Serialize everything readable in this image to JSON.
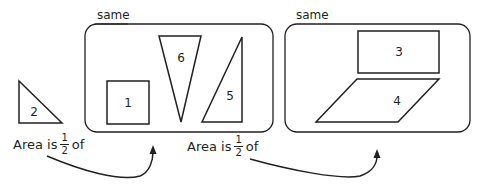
{
  "groups": [
    {
      "label": "same",
      "members": [
        "1",
        "5",
        "6"
      ]
    },
    {
      "label": "same",
      "members": [
        "3",
        "4"
      ]
    }
  ],
  "shapes": {
    "s1": {
      "label": "1",
      "type": "square"
    },
    "s2": {
      "label": "2",
      "type": "right-triangle"
    },
    "s3": {
      "label": "3",
      "type": "rectangle"
    },
    "s4": {
      "label": "4",
      "type": "parallelogram"
    },
    "s5": {
      "label": "5",
      "type": "right-triangle"
    },
    "s6": {
      "label": "6",
      "type": "isosceles-triangle"
    }
  },
  "captions": [
    {
      "prefix": "Area is",
      "numerator": "1",
      "denominator": "2",
      "suffix": "of"
    },
    {
      "prefix": "Area is",
      "numerator": "1",
      "denominator": "2",
      "suffix": "of"
    }
  ],
  "colors": {
    "stroke": "#231f20",
    "background": "#ffffff"
  }
}
